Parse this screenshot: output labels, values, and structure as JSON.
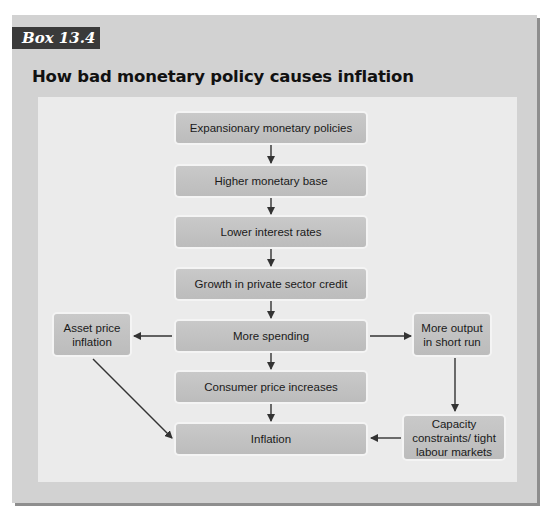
{
  "box_label": "Box 13.4",
  "title": "How bad monetary policy causes inflation",
  "colors": {
    "frame_bg": "#d2d2d2",
    "panel_bg": "#ebebeb",
    "label_bg": "#3a3a3a",
    "node_bg": "#c4c4c4",
    "arrow": "#333333"
  },
  "nodes": {
    "expansionary": "Expansionary monetary policies",
    "monetary_base": "Higher monetary base",
    "interest_rates": "Lower interest rates",
    "credit_growth": "Growth in private sector credit",
    "spending": "More spending",
    "consumer_prices": "Consumer price increases",
    "inflation": "Inflation",
    "asset_price": "Asset price inflation",
    "more_output": "More output in short run",
    "capacity": "Capacity constraints/ tight labour markets"
  },
  "edges": [
    [
      "expansionary",
      "monetary_base"
    ],
    [
      "monetary_base",
      "interest_rates"
    ],
    [
      "interest_rates",
      "credit_growth"
    ],
    [
      "credit_growth",
      "spending"
    ],
    [
      "spending",
      "consumer_prices"
    ],
    [
      "consumer_prices",
      "inflation"
    ],
    [
      "spending",
      "asset_price"
    ],
    [
      "spending",
      "more_output"
    ],
    [
      "asset_price",
      "inflation"
    ],
    [
      "more_output",
      "capacity"
    ],
    [
      "capacity",
      "inflation"
    ]
  ]
}
